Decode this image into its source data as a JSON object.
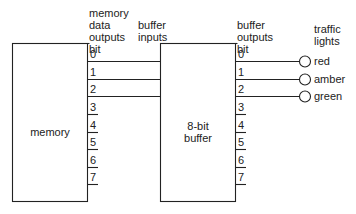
{
  "diagram": {
    "memory_block": {
      "label": "memory"
    },
    "buffer_block": {
      "label_line1": "8-bit",
      "label_line2": "buffer"
    },
    "headers": {
      "memory_outputs": [
        "memory",
        "data",
        "outputs",
        "bit"
      ],
      "buffer_inputs": [
        "buffer",
        "inputs"
      ],
      "buffer_outputs": [
        "buffer",
        "outputs",
        "bit"
      ],
      "traffic_lights": [
        "traffic",
        "lights"
      ]
    },
    "memory_bits": [
      "0",
      "1",
      "2",
      "3",
      "4",
      "5",
      "6",
      "7"
    ],
    "buffer_bits": [
      "0",
      "1",
      "2",
      "3",
      "4",
      "5",
      "6",
      "7"
    ],
    "lights": [
      {
        "bit": "0",
        "label": "red"
      },
      {
        "bit": "1",
        "label": "amber"
      },
      {
        "bit": "2",
        "label": "green"
      }
    ],
    "connections": [
      {
        "from": "memory bit 0",
        "to": "buffer input 0"
      },
      {
        "from": "memory bit 1",
        "to": "buffer input 1"
      },
      {
        "from": "memory bit 2",
        "to": "buffer input 2"
      },
      {
        "from": "buffer output 0",
        "to": "red"
      },
      {
        "from": "buffer output 1",
        "to": "amber"
      },
      {
        "from": "buffer output 2",
        "to": "green"
      }
    ]
  }
}
